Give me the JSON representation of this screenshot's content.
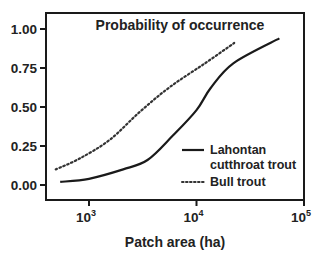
{
  "chart_data": {
    "type": "line",
    "title": "Probability of occurrence",
    "xlabel": "Patch area (ha)",
    "ylabel": "",
    "x_scale": "log",
    "xlim": [
      400,
      100000
    ],
    "ylim": [
      -0.1,
      1.1
    ],
    "x_ticks": [
      {
        "base": "10",
        "exp": "3",
        "value": 1000
      },
      {
        "base": "10",
        "exp": "4",
        "value": 10000
      },
      {
        "base": "10",
        "exp": "5",
        "value": 100000
      }
    ],
    "y_ticks": [
      "0.00",
      "0.25",
      "0.50",
      "0.75",
      "1.00"
    ],
    "grid": false,
    "legend_position": "lower right, inside plot",
    "series": [
      {
        "name": "Lahontan cutthroat trout",
        "legend_line1": "Lahontan",
        "legend_line2": "cutthroat trout",
        "style": "solid",
        "points": [
          [
            540,
            0.02
          ],
          [
            1000,
            0.04
          ],
          [
            2080,
            0.1
          ],
          [
            3500,
            0.16
          ],
          [
            5900,
            0.31
          ],
          [
            10000,
            0.48
          ],
          [
            13500,
            0.62
          ],
          [
            22000,
            0.78
          ],
          [
            59000,
            0.94
          ]
        ]
      },
      {
        "name": "Bull trout",
        "legend_line1": "Bull trout",
        "style": "dotted",
        "points": [
          [
            490,
            0.1
          ],
          [
            820,
            0.17
          ],
          [
            1560,
            0.29
          ],
          [
            2980,
            0.47
          ],
          [
            5700,
            0.63
          ],
          [
            12000,
            0.78
          ],
          [
            22400,
            0.91
          ]
        ]
      }
    ]
  },
  "plot": {
    "title": "Probability of occurrence",
    "xlabel": "Patch area (ha)"
  }
}
